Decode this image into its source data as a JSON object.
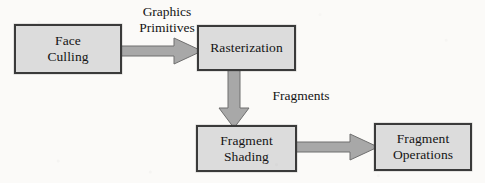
{
  "diagram": {
    "type": "flowchart",
    "direction": "left-to-right then top-to-bottom",
    "colors": {
      "background": "#fbfaf8",
      "node_fill": "#dcdcdc",
      "node_border": "#3a3a3a",
      "arrow_fill": "#a8a8a8",
      "arrow_border": "#6f6f6f",
      "text": "#141414"
    },
    "nodes": [
      {
        "id": "face-culling",
        "label": "Face\nCulling"
      },
      {
        "id": "rasterization",
        "label": "Rasterization"
      },
      {
        "id": "fragment-shading",
        "label": "Fragment\nShading"
      },
      {
        "id": "fragment-operations",
        "label": "Fragment\nOperations"
      }
    ],
    "edges": [
      {
        "id": "primitives",
        "from": "face-culling",
        "to": "rasterization",
        "label": "Graphics\nPrimitives",
        "direction": "right"
      },
      {
        "id": "fragments",
        "from": "rasterization",
        "to": "fragment-shading",
        "label": "Fragments",
        "direction": "down"
      },
      {
        "id": "shading",
        "from": "fragment-shading",
        "to": "fragment-operations",
        "label": "",
        "direction": "right"
      }
    ]
  }
}
